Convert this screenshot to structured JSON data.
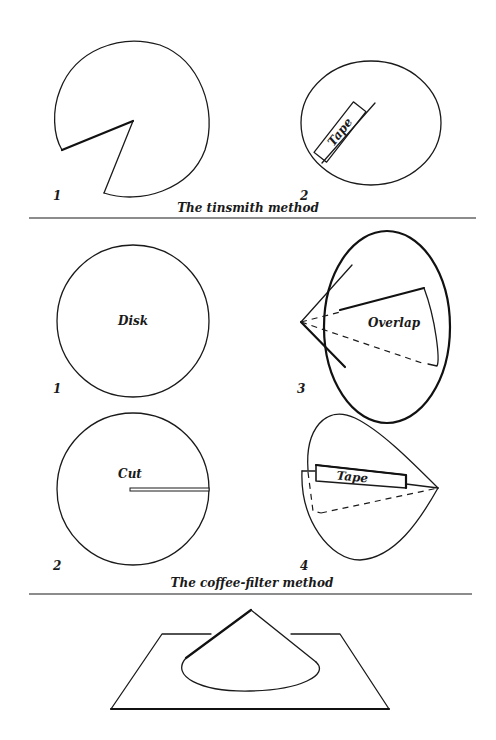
{
  "panels": {
    "tinsmith": {
      "caption": "The tinsmith method",
      "steps": [
        {
          "number": "1",
          "label": ""
        },
        {
          "number": "2",
          "label": "Tape"
        }
      ]
    },
    "coffee_filter": {
      "caption": "The coffee-filter method",
      "steps": [
        {
          "number": "1",
          "label": "Disk"
        },
        {
          "number": "2",
          "label": "Cut"
        },
        {
          "number": "3",
          "label": "Overlap"
        },
        {
          "number": "4",
          "label": "Tape"
        }
      ]
    },
    "result": {
      "description": "cone standing on a sheet"
    }
  }
}
